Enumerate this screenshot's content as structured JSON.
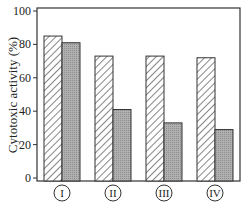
{
  "chart_data": {
    "type": "bar",
    "title": "",
    "xlabel": "",
    "ylabel": "Cytotoxic activity (%)",
    "ylim": [
      0,
      100
    ],
    "yticks": [
      0,
      20,
      40,
      60,
      80,
      100
    ],
    "categories": [
      "I",
      "II",
      "III",
      "IV"
    ],
    "series": [
      {
        "name": "hatched",
        "pattern": "diagonal-hatch",
        "values": [
          85,
          73,
          73,
          72
        ]
      },
      {
        "name": "gray",
        "pattern": "gray-fill",
        "values": [
          81,
          41,
          33,
          29
        ]
      }
    ],
    "grid": false,
    "legend": null
  },
  "colors": {
    "axis": "#333333",
    "hatch": "#444444",
    "gray_bar": "#a8a8a8"
  }
}
